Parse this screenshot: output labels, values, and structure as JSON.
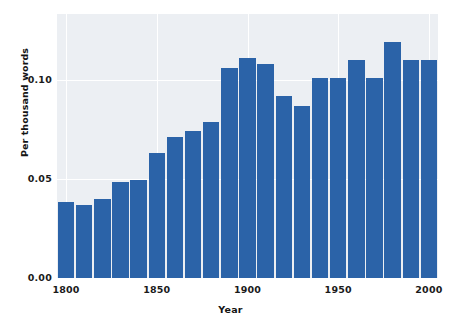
{
  "chart_data": {
    "type": "bar",
    "title": "",
    "subtitle": "",
    "xlabel": "Year",
    "ylabel": "Per thousand words",
    "categories": [
      1800,
      1810,
      1820,
      1830,
      1840,
      1850,
      1860,
      1870,
      1880,
      1890,
      1900,
      1910,
      1920,
      1930,
      1940,
      1950,
      1960,
      1970,
      1980,
      1990,
      2000
    ],
    "values": [
      0.0385,
      0.037,
      0.04,
      0.0485,
      0.0495,
      0.0632,
      0.0713,
      0.0743,
      0.0789,
      0.106,
      0.111,
      0.108,
      0.092,
      0.087,
      0.101,
      0.101,
      0.11,
      0.101,
      0.119,
      0.11,
      0.11
    ],
    "xlim": [
      1795,
      2005
    ],
    "ylim": [
      0.0,
      0.1333
    ],
    "xticks": [
      1800,
      1850,
      1900,
      1950,
      2000
    ],
    "xticklabels": [
      "1800",
      "1850",
      "1900",
      "1950",
      "2000"
    ],
    "yticks": [
      0.0,
      0.05,
      0.1
    ],
    "yticklabels": [
      "0.00",
      "0.05",
      "0.10"
    ],
    "grid": true,
    "grid_color": "#ffffff",
    "legend": null,
    "legend_position": "none",
    "bar_color": "#2b63a8",
    "plot_background": "#eceff3",
    "figure_background": "#ffffff",
    "annotations": []
  }
}
